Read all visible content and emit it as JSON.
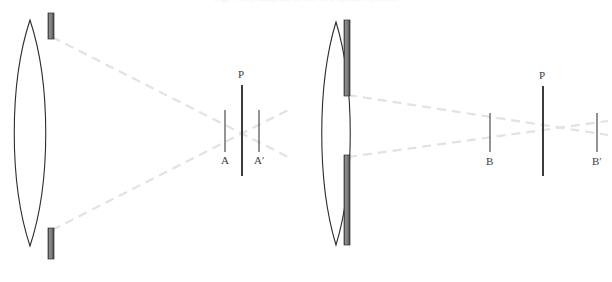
{
  "figure": {
    "title_clipped": "Fig. 1  Ray diagram of the two optical systems",
    "background_color": "#ffffff",
    "width": 612,
    "height": 282,
    "colors": {
      "lens_outline": "#2b2b2b",
      "bar_fill": "#808080",
      "bar_edge": "#3a3a3a",
      "ray_dashed": "#e2e2e2",
      "plane_line": "#3c3c3c",
      "marker_line": "#5a5a5a",
      "label_text": "#3c3c3c"
    }
  },
  "systems": [
    {
      "id": "left-system",
      "name": "converging-system",
      "lens": {
        "name": "biconvex-lens",
        "center_x": 30,
        "top_y": 20,
        "bottom_y": 246,
        "half_width": 21
      },
      "stops": [
        {
          "name": "upper-stop-bar",
          "x": 48,
          "y": 13,
          "width": 6,
          "height": 26
        },
        {
          "name": "lower-stop-bar",
          "x": 48,
          "y": 228,
          "width": 6,
          "height": 31
        }
      ],
      "rays": [
        {
          "name": "upper-ray",
          "x1": 52,
          "y1": 37,
          "x2": 290,
          "y2": 158
        },
        {
          "name": "lower-ray",
          "x1": 52,
          "y1": 230,
          "x2": 292,
          "y2": 108
        }
      ],
      "plane": {
        "name": "image-plane-P",
        "label": "P",
        "x": 242,
        "top_y": 85,
        "bottom_y": 176,
        "label_x": 238,
        "label_y": 69
      },
      "markers": [
        {
          "name": "marker-A",
          "label": "A",
          "x": 225,
          "top_y": 110,
          "bottom_y": 152,
          "label_x": 221,
          "label_y": 155
        },
        {
          "name": "marker-A-prime",
          "label": "A′",
          "x": 259,
          "top_y": 110,
          "bottom_y": 152,
          "label_x": 254,
          "label_y": 155
        }
      ]
    },
    {
      "id": "right-system",
      "name": "slit-aperture-system",
      "lens": {
        "name": "biconvex-lens",
        "center_x": 336,
        "top_y": 22,
        "bottom_y": 245,
        "half_width": 19
      },
      "stops": [
        {
          "name": "upper-slit-bar",
          "x": 344,
          "y": 20,
          "width": 6,
          "height": 76
        },
        {
          "name": "lower-slit-bar",
          "x": 344,
          "y": 155,
          "width": 6,
          "height": 90
        }
      ],
      "rays": [
        {
          "name": "upper-ray",
          "x1": 348,
          "y1": 95,
          "x2": 608,
          "y2": 135
        },
        {
          "name": "lower-ray",
          "x1": 348,
          "y1": 157,
          "x2": 608,
          "y2": 121
        }
      ],
      "plane": {
        "name": "image-plane-P",
        "label": "P",
        "x": 543,
        "top_y": 86,
        "bottom_y": 176,
        "label_x": 539,
        "label_y": 70
      },
      "markers": [
        {
          "name": "marker-B",
          "label": "B",
          "x": 490,
          "top_y": 113,
          "bottom_y": 152,
          "label_x": 486,
          "label_y": 156
        },
        {
          "name": "marker-B-prime",
          "label": "B′",
          "x": 597,
          "top_y": 113,
          "bottom_y": 152,
          "label_x": 592,
          "label_y": 156
        }
      ]
    }
  ]
}
